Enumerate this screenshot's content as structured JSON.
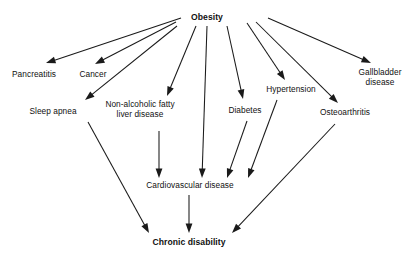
{
  "diagram": {
    "title": "Obesity",
    "type": "flowchart",
    "orientation": "top-down",
    "background_color": "#ffffff",
    "line_color": "#1a1a1a",
    "text_color": "#111111",
    "nodes": [
      {
        "id": "obesity",
        "label": "Obesity",
        "x": 207,
        "y": 18,
        "bold": true
      },
      {
        "id": "pancreatitis",
        "label": "Pancreatitis",
        "x": 34,
        "y": 75,
        "bold": false
      },
      {
        "id": "cancer",
        "label": "Cancer",
        "x": 93,
        "y": 75,
        "bold": false
      },
      {
        "id": "gallbladder",
        "label": "Gallbladder\ndisease",
        "x": 380,
        "y": 78,
        "bold": false
      },
      {
        "id": "hypertension",
        "label": "Hypertension",
        "x": 291,
        "y": 90,
        "bold": false
      },
      {
        "id": "sleep_apnea",
        "label": "Sleep apnea",
        "x": 53,
        "y": 112,
        "bold": false
      },
      {
        "id": "nafld",
        "label": "Non-alcoholic fatty\nliver disease",
        "x": 140,
        "y": 110,
        "bold": false
      },
      {
        "id": "diabetes",
        "label": "Diabetes",
        "x": 245,
        "y": 111,
        "bold": false
      },
      {
        "id": "osteoarthritis",
        "label": "Osteoarthritis",
        "x": 345,
        "y": 113,
        "bold": false
      },
      {
        "id": "cvd",
        "label": "Cardiovascular disease",
        "x": 190,
        "y": 186,
        "bold": false
      },
      {
        "id": "chronic",
        "label": "Chronic disability",
        "x": 189,
        "y": 243,
        "bold": true
      }
    ],
    "edges": [
      {
        "id": "obesity-pancreatitis",
        "from": "obesity",
        "to": "pancreatitis",
        "x1": 181,
        "y1": 18,
        "x2": 46,
        "y2": 63
      },
      {
        "id": "obesity-cancer",
        "from": "obesity",
        "to": "cancer",
        "x1": 176,
        "y1": 22,
        "x2": 95,
        "y2": 64
      },
      {
        "id": "obesity-sleep-apnea",
        "from": "obesity",
        "to": "sleep_apnea",
        "x1": 177,
        "y1": 26,
        "x2": 85,
        "y2": 100
      },
      {
        "id": "obesity-nafld",
        "from": "obesity",
        "to": "nafld",
        "x1": 196,
        "y1": 26,
        "x2": 167,
        "y2": 96
      },
      {
        "id": "obesity-cvd",
        "from": "obesity",
        "to": "cvd",
        "x1": 207,
        "y1": 26,
        "x2": 202,
        "y2": 178
      },
      {
        "id": "obesity-diabetes",
        "from": "obesity",
        "to": "diabetes",
        "x1": 227,
        "y1": 26,
        "x2": 243,
        "y2": 99
      },
      {
        "id": "obesity-hypertension",
        "from": "obesity",
        "to": "hypertension",
        "x1": 247,
        "y1": 23,
        "x2": 285,
        "y2": 80
      },
      {
        "id": "obesity-osteoarthritis",
        "from": "obesity",
        "to": "osteoarthritis",
        "x1": 256,
        "y1": 22,
        "x2": 338,
        "y2": 103
      },
      {
        "id": "obesity-gallbladder",
        "from": "obesity",
        "to": "gallbladder",
        "x1": 268,
        "y1": 18,
        "x2": 371,
        "y2": 63
      },
      {
        "id": "nafld-cvd",
        "from": "nafld",
        "to": "cvd",
        "x1": 159,
        "y1": 131,
        "x2": 159,
        "y2": 178
      },
      {
        "id": "diabetes-cvd",
        "from": "diabetes",
        "to": "cvd",
        "x1": 247,
        "y1": 121,
        "x2": 227,
        "y2": 178
      },
      {
        "id": "hypertension-cvd",
        "from": "hypertension",
        "to": "cvd",
        "x1": 277,
        "y1": 100,
        "x2": 248,
        "y2": 178
      },
      {
        "id": "sleep-apnea-chronic",
        "from": "sleep_apnea",
        "to": "chronic",
        "x1": 88,
        "y1": 122,
        "x2": 149,
        "y2": 233
      },
      {
        "id": "cvd-chronic",
        "from": "cvd",
        "to": "chronic",
        "x1": 189,
        "y1": 195,
        "x2": 189,
        "y2": 233
      },
      {
        "id": "osteoarthritis-chronic",
        "from": "osteoarthritis",
        "to": "chronic",
        "x1": 335,
        "y1": 124,
        "x2": 232,
        "y2": 233
      }
    ]
  }
}
